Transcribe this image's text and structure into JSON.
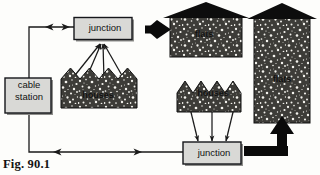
{
  "figure": {
    "caption": "Fig. 90.1"
  },
  "colors": {
    "background": "#fdfdfb",
    "line": "#1a1a1a",
    "box_fill": "#d9d9d6",
    "box_stroke": "#15161a",
    "box_shadow": "#8e8e8b",
    "speckle_base": "#3d3c38",
    "speckle_dot": "#f2f1ec",
    "roof": "#0d0d0d",
    "thick_arrow": "#0a0a0a"
  },
  "nodes": {
    "cable_station": {
      "label_line1": "cable",
      "label_line2": "station"
    },
    "junction_top": {
      "label": "junction"
    },
    "junction_bottom": {
      "label": "junction"
    },
    "houses_left": {
      "label": "houses"
    },
    "houses_middle": {
      "label": "houses"
    },
    "flats_small": {
      "label": "flats"
    },
    "flats_tall": {
      "label": "flats"
    }
  },
  "connectors": {
    "station_to_junction_top": {
      "style": "thin-bidirectional",
      "name": "cable-station-to-top-junction"
    },
    "station_to_junction_bottom": {
      "style": "thin-bidirectional",
      "name": "cable-station-to-bottom-junction"
    },
    "junction_top_to_houses": {
      "style": "thin-bidirectional-fan",
      "count": 4
    },
    "junction_bottom_to_houses": {
      "style": "thin-bidirectional-fan",
      "count": 3
    },
    "junction_top_to_flats_small": {
      "style": "thick-double-arrow"
    },
    "junction_bottom_to_flats_tall": {
      "style": "thick-elbow-arrow"
    }
  },
  "icons": {
    "arrowhead": "arrowhead-icon",
    "thick_arrow": "thick-arrow-icon",
    "house_roof": "house-roof-icon",
    "zigzag_roof": "zigzag-roof-icon"
  }
}
